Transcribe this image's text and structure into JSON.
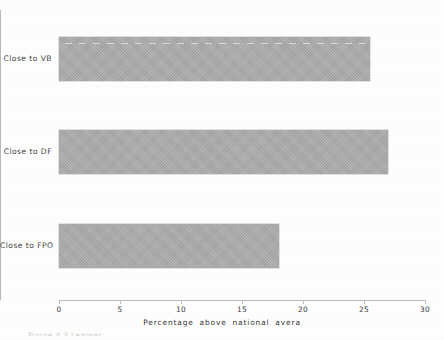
{
  "figure": {
    "caption_partial": "Figure 4.3 Learner"
  },
  "chart_data": {
    "type": "bar",
    "orientation": "horizontal",
    "title": "",
    "xlabel": "Percentage  above  national  avera",
    "ylabel": "",
    "categories": [
      "Close to FPO",
      "Close to DF",
      "Close to VB"
    ],
    "values": [
      18,
      27,
      25.5
    ],
    "series": [
      {
        "name": "Percentage above national average",
        "values": [
          18,
          27,
          25.5
        ]
      }
    ],
    "xlim": [
      0,
      30
    ],
    "xticks": [
      0,
      5,
      10,
      15,
      20,
      25,
      30
    ],
    "xtick_labels": [
      "0",
      "5",
      "10",
      "15",
      "20",
      "25",
      "30"
    ],
    "grid": false,
    "legend": false,
    "bar_color": "#a9a9a9",
    "axis_color": "#b9b9b9"
  },
  "axis": {
    "x_title": "Percentage  above  national  avera",
    "tick_labels": [
      "0",
      "5",
      "10",
      "15",
      "20",
      "25",
      "30"
    ]
  },
  "bars": [
    {
      "label": "Close to VB",
      "value": 25.5
    },
    {
      "label": "Close to DF",
      "value": 27
    },
    {
      "label": "Close to FPO",
      "value": 18
    }
  ]
}
